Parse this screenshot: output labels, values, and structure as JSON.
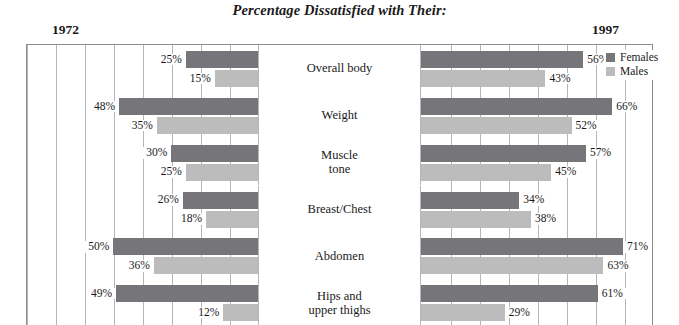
{
  "chart_data": {
    "type": "bar",
    "title": "Percentage Dissatisfied with Their:",
    "orientation": "horizontal",
    "layout": "bidirectional-panels",
    "xlabel": "",
    "ylabel": "",
    "xlim": [
      0,
      80
    ],
    "grid": true,
    "grid_step": 10,
    "legend_position": "right",
    "panels": [
      {
        "name": "1972",
        "label": "1972",
        "direction": "left"
      },
      {
        "name": "1997",
        "label": "1997",
        "direction": "right"
      }
    ],
    "categories": [
      "Overall body",
      "Weight",
      "Muscle tone",
      "Breast/Chest",
      "Abdomen",
      "Hips and upper thighs"
    ],
    "series": [
      {
        "name": "Females",
        "panel": "1972",
        "color": "#76767a",
        "values": [
          25,
          48,
          30,
          26,
          50,
          49
        ]
      },
      {
        "name": "Males",
        "panel": "1972",
        "color": "#bcbcbc",
        "values": [
          15,
          35,
          25,
          18,
          36,
          12
        ]
      },
      {
        "name": "Females",
        "panel": "1997",
        "color": "#76767a",
        "values": [
          56,
          66,
          57,
          34,
          71,
          61
        ]
      },
      {
        "name": "Males",
        "panel": "1997",
        "color": "#bcbcbc",
        "values": [
          43,
          52,
          45,
          38,
          63,
          29
        ]
      }
    ]
  },
  "title": "Percentage Dissatisfied with Their:",
  "years": {
    "left": "1972",
    "right": "1997"
  },
  "legend": {
    "females": "Females",
    "males": "Males"
  },
  "rows": [
    {
      "label_line1": "Overall body",
      "label_line2": "",
      "left": {
        "f_value": 25,
        "f_text": "25%",
        "m_value": 15,
        "m_text": "15%"
      },
      "right": {
        "f_value": 56,
        "f_text": "56%",
        "m_value": 43,
        "m_text": "43%"
      }
    },
    {
      "label_line1": "Weight",
      "label_line2": "",
      "left": {
        "f_value": 48,
        "f_text": "48%",
        "m_value": 35,
        "m_text": "35%"
      },
      "right": {
        "f_value": 66,
        "f_text": "66%",
        "m_value": 52,
        "m_text": "52%"
      }
    },
    {
      "label_line1": "Muscle",
      "label_line2": "tone",
      "left": {
        "f_value": 30,
        "f_text": "30%",
        "m_value": 25,
        "m_text": "25%"
      },
      "right": {
        "f_value": 57,
        "f_text": "57%",
        "m_value": 45,
        "m_text": "45%"
      }
    },
    {
      "label_line1": "Breast/Chest",
      "label_line2": "",
      "left": {
        "f_value": 26,
        "f_text": "26%",
        "m_value": 18,
        "m_text": "18%"
      },
      "right": {
        "f_value": 34,
        "f_text": "34%",
        "m_value": 38,
        "m_text": "38%"
      }
    },
    {
      "label_line1": "Abdomen",
      "label_line2": "",
      "left": {
        "f_value": 50,
        "f_text": "50%",
        "m_value": 36,
        "m_text": "36%"
      },
      "right": {
        "f_value": 71,
        "f_text": "71%",
        "m_value": 63,
        "m_text": "63%"
      }
    },
    {
      "label_line1": "Hips and",
      "label_line2": "upper thighs",
      "left": {
        "f_value": 49,
        "f_text": "49%",
        "m_value": 12,
        "m_text": "12%"
      },
      "right": {
        "f_value": 61,
        "f_text": "61%",
        "m_value": 29,
        "m_text": "29%"
      }
    }
  ]
}
